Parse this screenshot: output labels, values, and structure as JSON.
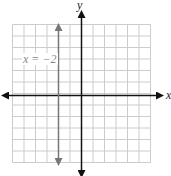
{
  "chart_data": {
    "type": "line",
    "title": "",
    "xlabel": "x",
    "ylabel": "y",
    "xlim": [
      -6,
      6
    ],
    "ylim": [
      -6,
      6
    ],
    "grid": true,
    "series": [
      {
        "name": "x = -2",
        "type": "vertical-line",
        "x": -2,
        "color": "#777777"
      }
    ],
    "annotations": [
      {
        "text": "x = −2",
        "x": -4.5,
        "y": 2.5
      }
    ]
  },
  "labels": {
    "x_axis": "x",
    "y_axis": "y",
    "equation": "x = −2"
  },
  "colors": {
    "grid": "#cccccc",
    "axes": "#111111",
    "line": "#777777"
  }
}
